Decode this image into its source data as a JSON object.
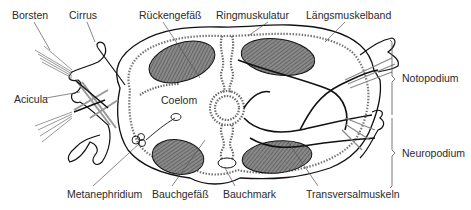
{
  "diagram": {
    "labels": {
      "borsten": "Borsten",
      "cirrus": "Cirrus",
      "rueckengefaess": "Rückengefäß",
      "ringmuskulatur": "Ringmuskulatur",
      "laengsmuskelband": "Längsmuskelband",
      "acicula": "Acicula",
      "coelom": "Coelom",
      "notopodium": "Notopodium",
      "neuropodium": "Neuropodium",
      "metanephridium": "Metanephridium",
      "bauchgefaess": "Bauchgefäß",
      "bauchmark": "Bauchmark",
      "transversalmuskeln": "Transversalmuskeln"
    },
    "colors": {
      "outline": "#111111",
      "muscle_fill": "#6e6e6e",
      "leader": "#555555",
      "text": "#2a2a2a"
    }
  }
}
